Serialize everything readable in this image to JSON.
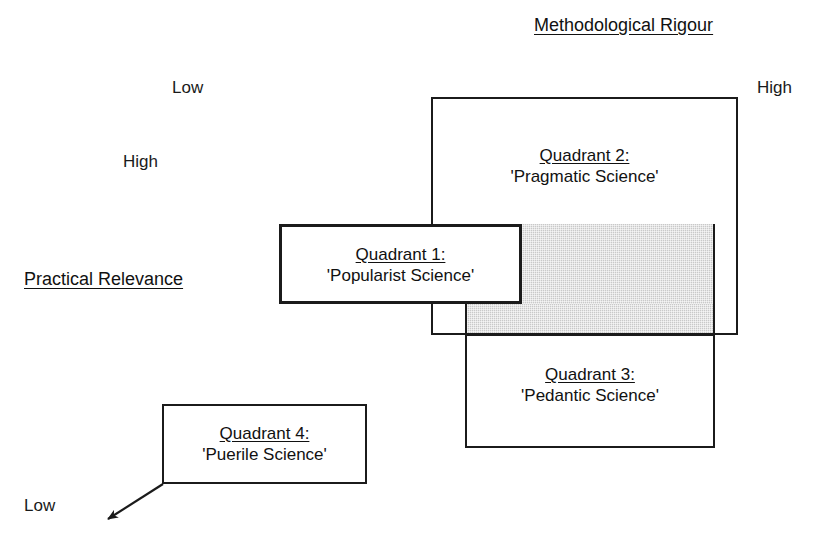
{
  "diagram": {
    "type": "quadrant-overlap-diagram",
    "background_color": "#ffffff",
    "line_color": "#1b1b1b",
    "shade_color": "#c9c9c9",
    "axes": {
      "horizontal": {
        "title": "Methodological Rigour",
        "low_label": "Low",
        "high_label": "High"
      },
      "vertical": {
        "title": "Practical Relevance",
        "high_label": "High",
        "low_label": "Low"
      }
    },
    "quadrants": [
      {
        "id": "quadrant-1",
        "title": "Quadrant 1:",
        "name": "'Popularist Science'"
      },
      {
        "id": "quadrant-2",
        "title": "Quadrant 2:",
        "name": "'Pragmatic Science'"
      },
      {
        "id": "quadrant-3",
        "title": "Quadrant 3:",
        "name": "'Pedantic Science'"
      },
      {
        "id": "quadrant-4",
        "title": "Quadrant 4:",
        "name": "'Puerile Science'"
      }
    ]
  }
}
